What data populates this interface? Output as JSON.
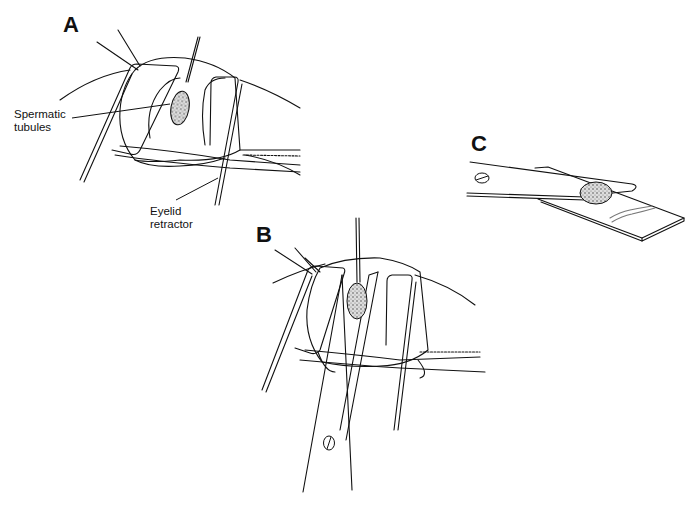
{
  "figure": {
    "panels": [
      {
        "id": "A",
        "label": "A"
      },
      {
        "id": "B",
        "label": "B"
      },
      {
        "id": "C",
        "label": "C"
      }
    ],
    "callouts": {
      "spermatic_tubules": {
        "line1": "Spermatic",
        "line2": "tubules"
      },
      "eyelid_retractor": {
        "line1": "Eyelid",
        "line2": "retractor"
      }
    },
    "colors": {
      "ink": "#111111",
      "background": "#ffffff",
      "tissue_stipple": "#555555"
    }
  }
}
